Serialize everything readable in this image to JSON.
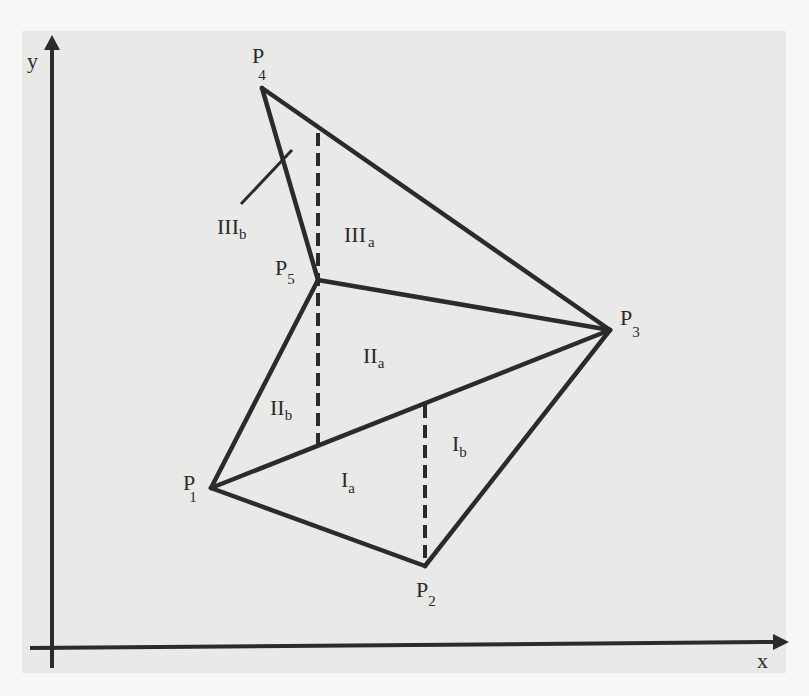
{
  "figure": {
    "axes": {
      "x_label": "x",
      "y_label": "y"
    },
    "points": [
      {
        "id": "P1",
        "letter": "P",
        "sub": "1",
        "x": 211,
        "y": 488
      },
      {
        "id": "P2",
        "letter": "P",
        "sub": "2",
        "x": 425,
        "y": 566
      },
      {
        "id": "P3",
        "letter": "P",
        "sub": "3",
        "x": 610,
        "y": 330
      },
      {
        "id": "P4",
        "letter": "P",
        "sub": "4",
        "x": 262,
        "y": 88
      },
      {
        "id": "P5",
        "letter": "P",
        "sub": "5",
        "x": 318,
        "y": 280
      }
    ],
    "edges": [
      [
        "P1",
        "P2"
      ],
      [
        "P2",
        "P3"
      ],
      [
        "P1",
        "P3"
      ],
      [
        "P1",
        "P5"
      ],
      [
        "P5",
        "P3"
      ],
      [
        "P4",
        "P5"
      ],
      [
        "P4",
        "P3"
      ]
    ],
    "dashed_lines": [
      {
        "from": [
          318,
          133
        ],
        "to": [
          318,
          445
        ]
      },
      {
        "from": [
          425,
          405
        ],
        "to": [
          425,
          566
        ]
      }
    ],
    "regions": [
      {
        "id": "Ia",
        "roman": "I",
        "sub": "a"
      },
      {
        "id": "Ib",
        "roman": "I",
        "sub": "b"
      },
      {
        "id": "IIa",
        "roman": "II",
        "sub": "a"
      },
      {
        "id": "IIb",
        "roman": "II",
        "sub": "b"
      },
      {
        "id": "IIIa",
        "roman": "III",
        "sub": "a"
      },
      {
        "id": "IIIb",
        "roman": "III",
        "sub": "b"
      }
    ],
    "colors": {
      "line": "#2b2b2b",
      "panel": "#e9e9e7",
      "page": "#f7f7f5"
    }
  }
}
